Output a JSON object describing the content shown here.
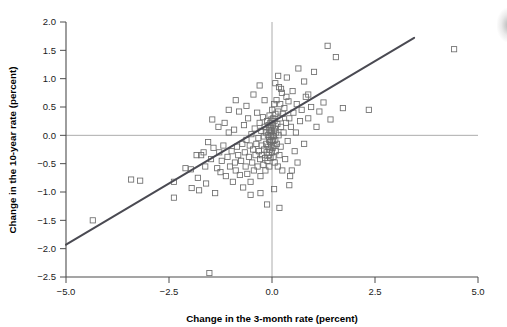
{
  "chart_data": {
    "type": "scatter",
    "title": "",
    "xlabel": "Change in the 3-month rate (percent)",
    "ylabel": "Change in the 10-year rate (percent)",
    "xlim": [
      -5.0,
      5.0
    ],
    "ylim": [
      -2.5,
      2.0
    ],
    "xticks": [
      -5.0,
      -2.5,
      0.0,
      2.5,
      5.0
    ],
    "xtick_labels": [
      "−5.0",
      "−2.5",
      "0.0",
      "2.5",
      "5.0"
    ],
    "yticks": [
      -2.5,
      -2.0,
      -1.5,
      -1.0,
      -0.5,
      0.0,
      0.5,
      1.0,
      1.5,
      2.0
    ],
    "ytick_labels": [
      "−2.5",
      "−2.0",
      "−1.5",
      "−1.0",
      "−0.5",
      "0.0",
      "0.5",
      "1.0",
      "1.5",
      "2.0"
    ],
    "grid": false,
    "reference_lines": [
      {
        "name": "zero-horizontal",
        "orientation": "horizontal",
        "value": 0.0,
        "color": "#9a9a9a"
      },
      {
        "name": "zero-vertical",
        "orientation": "vertical",
        "value": 0.0,
        "color": "#9a9a9a"
      }
    ],
    "legend": null,
    "marker": {
      "shape": "open-square",
      "size": 5.2,
      "edge_color": "#6d6d6d",
      "fill": "none"
    },
    "fit_line": {
      "name": "regression-line",
      "color": "#4a4a52",
      "width": 2.0,
      "x_start": -5.0,
      "y_start": -1.93,
      "x_end": 3.45,
      "y_end": 1.72,
      "slope": 0.432,
      "intercept": 0.23
    },
    "points": [
      [
        -4.35,
        -1.5
      ],
      [
        -3.42,
        -0.78
      ],
      [
        -3.2,
        -0.8
      ],
      [
        -2.38,
        -0.82
      ],
      [
        -2.38,
        -1.1
      ],
      [
        -2.1,
        -0.58
      ],
      [
        -1.97,
        -0.6
      ],
      [
        -1.95,
        -0.93
      ],
      [
        -1.83,
        -0.35
      ],
      [
        -1.8,
        -0.75
      ],
      [
        -1.77,
        -0.97
      ],
      [
        -1.72,
        -0.35
      ],
      [
        -1.66,
        -0.3
      ],
      [
        -1.62,
        -0.55
      ],
      [
        -1.6,
        -0.85
      ],
      [
        -1.55,
        -0.12
      ],
      [
        -1.52,
        -2.43
      ],
      [
        -1.48,
        -0.42
      ],
      [
        -1.45,
        0.28
      ],
      [
        -1.42,
        -0.22
      ],
      [
        -1.38,
        -1.02
      ],
      [
        -1.33,
        -0.58
      ],
      [
        -1.3,
        0.15
      ],
      [
        -1.28,
        -0.3
      ],
      [
        -1.25,
        -0.65
      ],
      [
        -1.22,
        -0.45
      ],
      [
        -1.18,
        -0.18
      ],
      [
        -1.15,
        0.22
      ],
      [
        -1.12,
        -0.72
      ],
      [
        -1.08,
        -0.38
      ],
      [
        -1.05,
        0.05
      ],
      [
        -1.02,
        -0.55
      ],
      [
        -0.98,
        -0.28
      ],
      [
        -0.95,
        -0.82
      ],
      [
        -0.92,
        0.1
      ],
      [
        -0.9,
        -0.48
      ],
      [
        -0.88,
        -0.62
      ],
      [
        -0.85,
        -0.2
      ],
      [
        -0.82,
        -0.35
      ],
      [
        -0.8,
        0.42
      ],
      [
        -0.78,
        -0.7
      ],
      [
        -0.75,
        -0.45
      ],
      [
        -0.72,
        -0.15
      ],
      [
        -0.7,
        -0.92
      ],
      [
        -0.68,
        0.18
      ],
      [
        -0.66,
        -0.3
      ],
      [
        -0.64,
        -0.55
      ],
      [
        -0.62,
        -0.08
      ],
      [
        -0.6,
        -0.68
      ],
      [
        -0.58,
        0.3
      ],
      [
        -0.56,
        -0.38
      ],
      [
        -0.54,
        -0.18
      ],
      [
        -0.52,
        -0.82
      ],
      [
        -0.5,
        0.02
      ],
      [
        -0.48,
        -0.48
      ],
      [
        -0.46,
        -0.25
      ],
      [
        -0.44,
        -0.62
      ],
      [
        -0.42,
        0.12
      ],
      [
        -0.4,
        -0.35
      ],
      [
        -0.38,
        -0.15
      ],
      [
        -0.36,
        0.4
      ],
      [
        -0.35,
        -0.55
      ],
      [
        -0.33,
        -0.05
      ],
      [
        -0.32,
        -0.28
      ],
      [
        -0.3,
        0.22
      ],
      [
        -0.29,
        -0.42
      ],
      [
        -0.28,
        -0.72
      ],
      [
        -0.26,
        0.08
      ],
      [
        -0.25,
        -0.18
      ],
      [
        -0.24,
        -0.35
      ],
      [
        -0.22,
        0.32
      ],
      [
        -0.21,
        -0.52
      ],
      [
        -0.2,
        -0.02
      ],
      [
        -0.19,
        -0.25
      ],
      [
        -0.18,
        0.15
      ],
      [
        -0.17,
        -0.4
      ],
      [
        -0.16,
        -0.62
      ],
      [
        -0.15,
        0.05
      ],
      [
        -0.14,
        -0.15
      ],
      [
        -0.13,
        -0.3
      ],
      [
        -0.12,
        0.25
      ],
      [
        -0.11,
        -0.45
      ],
      [
        -0.1,
        0.0
      ],
      [
        -0.09,
        -0.2
      ],
      [
        -0.085,
        0.18
      ],
      [
        -0.08,
        -0.35
      ],
      [
        -0.075,
        0.1
      ],
      [
        -0.07,
        -0.08
      ],
      [
        -0.065,
        -0.55
      ],
      [
        -0.06,
        0.35
      ],
      [
        -0.055,
        -0.25
      ],
      [
        -0.05,
        0.05
      ],
      [
        -0.045,
        -0.12
      ],
      [
        -0.04,
        0.22
      ],
      [
        -0.035,
        -0.4
      ],
      [
        -0.03,
        -0.02
      ],
      [
        -0.025,
        0.14
      ],
      [
        -0.02,
        -0.18
      ],
      [
        -0.015,
        0.28
      ],
      [
        -0.01,
        -0.08
      ],
      [
        -0.005,
        0.08
      ],
      [
        0.0,
        -0.3
      ],
      [
        0.005,
        0.45
      ],
      [
        0.01,
        0.0
      ],
      [
        0.015,
        -0.22
      ],
      [
        0.02,
        0.18
      ],
      [
        0.025,
        -0.1
      ],
      [
        0.03,
        0.3
      ],
      [
        0.035,
        -0.38
      ],
      [
        0.04,
        0.08
      ],
      [
        0.045,
        -0.02
      ],
      [
        0.05,
        0.55
      ],
      [
        0.055,
        -0.18
      ],
      [
        0.06,
        0.25
      ],
      [
        0.065,
        -0.48
      ],
      [
        0.07,
        0.12
      ],
      [
        0.08,
        -0.08
      ],
      [
        0.085,
        0.38
      ],
      [
        0.09,
        -0.28
      ],
      [
        0.1,
        0.05
      ],
      [
        0.11,
        0.62
      ],
      [
        0.12,
        -0.15
      ],
      [
        0.13,
        0.2
      ],
      [
        0.14,
        -0.55
      ],
      [
        0.15,
        0.42
      ],
      [
        0.16,
        0.0
      ],
      [
        0.17,
        0.85
      ],
      [
        0.18,
        -0.35
      ],
      [
        0.19,
        0.3
      ],
      [
        0.2,
        0.55
      ],
      [
        0.21,
        -0.2
      ],
      [
        0.22,
        0.15
      ],
      [
        0.24,
        0.75
      ],
      [
        0.25,
        -0.62
      ],
      [
        0.26,
        0.38
      ],
      [
        0.28,
        0.05
      ],
      [
        0.3,
        0.48
      ],
      [
        0.32,
        -0.42
      ],
      [
        0.34,
        0.22
      ],
      [
        0.36,
        1.02
      ],
      [
        0.38,
        -0.1
      ],
      [
        0.4,
        0.6
      ],
      [
        0.42,
        0.3
      ],
      [
        0.44,
        -0.72
      ],
      [
        0.46,
        0.15
      ],
      [
        0.5,
        0.78
      ],
      [
        0.52,
        0.4
      ],
      [
        0.55,
        -0.28
      ],
      [
        0.58,
        0.05
      ],
      [
        0.6,
        0.55
      ],
      [
        0.64,
        1.18
      ],
      [
        0.68,
        0.25
      ],
      [
        0.72,
        0.45
      ],
      [
        0.78,
        -0.15
      ],
      [
        0.82,
        0.68
      ],
      [
        0.88,
        0.3
      ],
      [
        0.95,
        0.5
      ],
      [
        1.02,
        1.12
      ],
      [
        1.08,
        0.15
      ],
      [
        1.15,
        0.42
      ],
      [
        1.25,
        0.58
      ],
      [
        1.35,
        1.58
      ],
      [
        1.42,
        0.28
      ],
      [
        1.55,
        1.38
      ],
      [
        1.72,
        0.48
      ],
      [
        2.35,
        0.45
      ],
      [
        4.42,
        1.52
      ],
      [
        -0.28,
        -1.02
      ],
      [
        -0.12,
        -1.22
      ],
      [
        0.18,
        -1.28
      ],
      [
        0.05,
        -0.95
      ],
      [
        0.42,
        -0.88
      ],
      [
        -0.45,
        0.72
      ],
      [
        -0.3,
        0.88
      ],
      [
        0.15,
        1.05
      ],
      [
        0.08,
        0.92
      ],
      [
        0.22,
        0.82
      ],
      [
        -0.62,
        0.52
      ],
      [
        -0.88,
        0.62
      ],
      [
        -1.05,
        0.45
      ],
      [
        0.62,
        -0.48
      ],
      [
        0.48,
        -0.62
      ],
      [
        0.78,
        0.95
      ],
      [
        0.88,
        0.72
      ],
      [
        -0.18,
        0.62
      ],
      [
        0.35,
        0.68
      ],
      [
        -0.52,
        -1.05
      ]
    ]
  },
  "axis": {
    "x_title": "Change in the 3-month rate (percent)",
    "y_title": "Change in the 10-year rate (percent)"
  }
}
